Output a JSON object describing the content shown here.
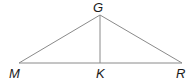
{
  "diagram": {
    "type": "triangle-with-altitude",
    "points": {
      "G": {
        "label": "G",
        "x": 100,
        "y": 15
      },
      "M": {
        "label": "M",
        "x": 19,
        "y": 63
      },
      "K": {
        "label": "K",
        "x": 100,
        "y": 63
      },
      "R": {
        "label": "R",
        "x": 182,
        "y": 63
      }
    },
    "segments": [
      {
        "from": "G",
        "to": "M"
      },
      {
        "from": "G",
        "to": "R"
      },
      {
        "from": "M",
        "to": "R"
      },
      {
        "from": "G",
        "to": "K"
      }
    ],
    "line_color": "#8a8a8a",
    "label_color": "#1a1a1a"
  }
}
